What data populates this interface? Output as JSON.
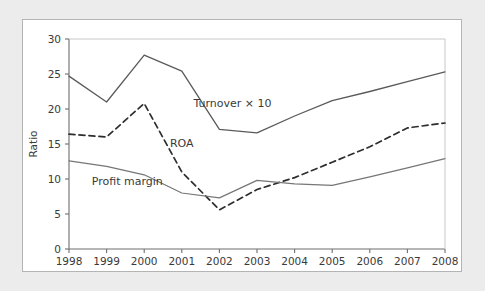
{
  "figure": {
    "background_color": "#ececec",
    "panel_color": "#ffffff",
    "panel_border_color": "#b4b4b4"
  },
  "chart_data": {
    "type": "line",
    "title": "",
    "xlabel": "",
    "ylabel": "Ratio",
    "x": [
      1998,
      1999,
      2000,
      2001,
      2002,
      2003,
      2004,
      2005,
      2006,
      2007,
      2008
    ],
    "categories": [
      "1998",
      "1999",
      "2000",
      "2001",
      "2002",
      "2003",
      "2004",
      "2005",
      "2006",
      "2007",
      "2008"
    ],
    "xlim": [
      1998,
      2008
    ],
    "ylim": [
      0,
      30
    ],
    "yticks": [
      0,
      5,
      10,
      15,
      20,
      25,
      30
    ],
    "ytick_labels": [
      "0",
      "5",
      "10",
      "15",
      "20",
      "25",
      "30"
    ],
    "grid": false,
    "legend": "inline-annotations",
    "series": [
      {
        "name": "Turnover × 10",
        "style": "solid",
        "color": "#5a5a5a",
        "label": "Turnover × 10",
        "values": [
          24.7,
          21.0,
          27.7,
          25.4,
          17.1,
          16.6,
          19.0,
          21.2,
          22.5,
          23.9,
          25.3
        ]
      },
      {
        "name": "ROA",
        "style": "dashed",
        "color": "#2d2d2d",
        "label": "ROA",
        "values": [
          16.4,
          16.0,
          20.8,
          11.0,
          5.6,
          8.5,
          10.2,
          12.4,
          14.6,
          17.3,
          18.0
        ]
      },
      {
        "name": "Profit margin",
        "style": "solid-thin",
        "color": "#767676",
        "label": "Profit margin",
        "values": [
          12.6,
          11.8,
          10.6,
          8.0,
          7.3,
          9.8,
          9.3,
          9.1,
          10.3,
          11.6,
          12.9
        ]
      }
    ],
    "annotations": [
      {
        "text": "Turnover × 10",
        "x": 2002.35,
        "y": 20.3,
        "anchor": "middle"
      },
      {
        "text": "ROA",
        "x": 2001.0,
        "y": 14.6,
        "anchor": "middle"
      },
      {
        "text": "Profit margin",
        "x": 1999.55,
        "y": 9.1,
        "anchor": "middle"
      }
    ]
  }
}
